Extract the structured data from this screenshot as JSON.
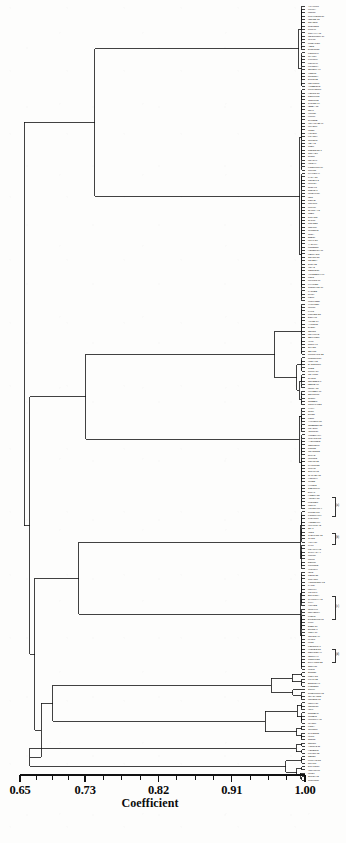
{
  "figure": {
    "kind": "dendrogram",
    "background_color": "#fdfdfc",
    "line_color": "#111111"
  },
  "axis": {
    "title": "Coefficient",
    "tick_labels": [
      "0.65",
      "0.73",
      "0.82",
      "0.91",
      "1.00"
    ],
    "tick_values": [
      0.65,
      0.73,
      0.82,
      0.91,
      1.0
    ],
    "minor_ticks_between": 3,
    "range": [
      0.65,
      1.0
    ]
  },
  "chart_data": {
    "type": "dendrogram",
    "title": "",
    "xlabel": "Coefficient",
    "ylabel": "",
    "xlim": [
      0.65,
      1.0
    ],
    "grid": false,
    "legend": "none",
    "orientation": "horizontal-right-leaves",
    "linkage_note": "UPGMA similarity dendrogram; leaves aligned at coefficient 1.00",
    "n_leaves": 232,
    "root_coefficient": 0.655,
    "merge_coefficients": [
      0.655,
      0.662,
      0.668,
      0.676,
      0.683,
      0.69,
      0.697,
      0.704,
      0.712,
      0.719,
      0.726,
      0.733,
      0.741,
      0.748,
      0.755,
      0.762,
      0.77,
      0.777,
      0.784,
      0.791,
      0.799,
      0.806,
      0.813,
      0.82,
      0.828,
      0.835,
      0.842,
      0.849,
      0.857,
      0.864,
      0.871,
      0.878,
      0.886,
      0.893,
      0.9,
      0.907,
      0.915,
      0.922,
      0.929,
      0.936,
      0.944,
      0.951,
      0.958,
      0.965,
      0.973,
      0.98,
      0.987,
      0.994
    ],
    "major_clusters": [
      {
        "name": "cluster-I",
        "leaf_span": [
          0,
          88
        ],
        "join_coefficient": 0.742
      },
      {
        "name": "cluster-II",
        "leaf_span": [
          89,
          150
        ],
        "join_coefficient": 0.731
      },
      {
        "name": "cluster-III",
        "leaf_span": [
          151,
          198
        ],
        "join_coefficient": 0.722
      },
      {
        "name": "cluster-IV",
        "leaf_span": [
          199,
          219
        ],
        "join_coefficient": 0.69
      },
      {
        "name": "outliers",
        "leaf_span": [
          220,
          231
        ],
        "join_coefficient": 0.662
      }
    ]
  },
  "leaf_labels": {
    "note": "Accession codes rendered as microtext at the right margin; individual glyphs are below the scan's resolution.",
    "sample_visible": [
      "B-11-3",
      "Sasagi",
      "Plus-77",
      "W101"
    ]
  },
  "group_annotations": [
    {
      "tag": "(a)",
      "top": 497,
      "height": 18
    },
    {
      "tag": "(b)",
      "top": 533,
      "height": 10
    },
    {
      "tag": "(c)",
      "top": 596,
      "height": 22
    },
    {
      "tag": "(d)",
      "top": 649,
      "height": 12
    }
  ]
}
